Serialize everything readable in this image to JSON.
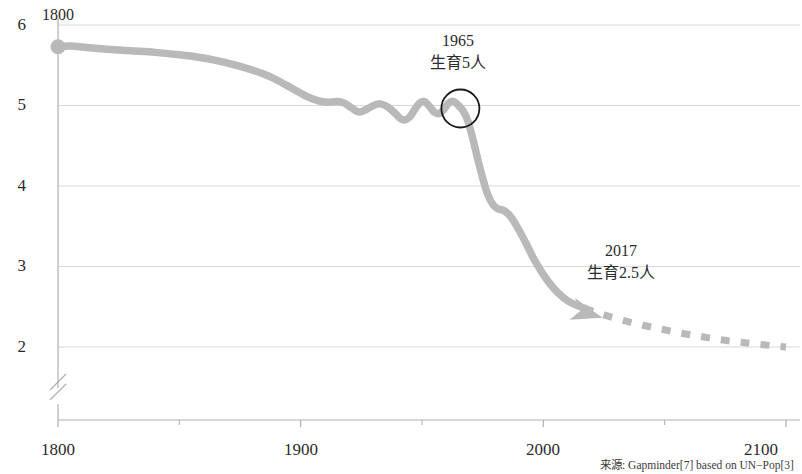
{
  "chart_data": {
    "type": "line",
    "title": "",
    "subtitle": "",
    "xlabel": "",
    "ylabel": "",
    "xlim": [
      1800,
      2100
    ],
    "ylim": [
      1.78,
      6.15
    ],
    "grid": true,
    "legend": null,
    "y_axis_break": true,
    "x_ticks": [
      "1800",
      "1900",
      "2000",
      "2100"
    ],
    "x_tick_values": [
      1800,
      1900,
      2000,
      2100
    ],
    "x_minor_tick_values": [
      1850,
      1950,
      2050
    ],
    "y_ticks": [
      "2",
      "3",
      "4",
      "5",
      "6"
    ],
    "y_tick_values": [
      2,
      3,
      4,
      5,
      6
    ],
    "line_color": "#b9b9b9",
    "series": [
      {
        "name": "historical",
        "style": "solid",
        "x": [
          1800,
          1805,
          1812,
          1820,
          1830,
          1840,
          1850,
          1858,
          1865,
          1872,
          1878,
          1884,
          1890,
          1896,
          1902,
          1907,
          1911,
          1915,
          1918,
          1921,
          1924,
          1927,
          1930,
          1933,
          1936,
          1939,
          1941,
          1943,
          1945,
          1947,
          1949,
          1951,
          1953,
          1955,
          1957,
          1959,
          1961,
          1963,
          1965,
          1967,
          1969,
          1971,
          1973,
          1975,
          1977,
          1979,
          1981,
          1984,
          1987,
          1990,
          1993,
          1996,
          2000,
          2004,
          2008,
          2012,
          2017
        ],
        "y": [
          5.73,
          5.74,
          5.72,
          5.7,
          5.68,
          5.66,
          5.63,
          5.6,
          5.56,
          5.51,
          5.46,
          5.4,
          5.32,
          5.22,
          5.12,
          5.06,
          5.04,
          5.05,
          5.03,
          4.97,
          4.92,
          4.95,
          5.0,
          5.02,
          4.98,
          4.9,
          4.84,
          4.82,
          4.86,
          4.95,
          5.03,
          5.05,
          4.99,
          4.92,
          4.9,
          4.95,
          5.03,
          5.05,
          5.0,
          4.93,
          4.8,
          4.58,
          4.33,
          4.1,
          3.9,
          3.78,
          3.72,
          3.69,
          3.6,
          3.45,
          3.28,
          3.1,
          2.9,
          2.74,
          2.62,
          2.54,
          2.48
        ]
      },
      {
        "name": "projection",
        "style": "dashed",
        "x": [
          2017,
          2025,
          2033,
          2041,
          2049,
          2057,
          2065,
          2073,
          2081,
          2090,
          2100
        ],
        "y": [
          2.48,
          2.4,
          2.33,
          2.27,
          2.22,
          2.17,
          2.13,
          2.09,
          2.06,
          2.03,
          2.0
        ]
      }
    ],
    "annotations": [
      {
        "id": "start-year",
        "label": "1800",
        "x": 1800,
        "y": 6.0,
        "kind": "text"
      },
      {
        "id": "marker-1965",
        "year": "1965",
        "text": "生育5人",
        "x": 1965,
        "y": 5.0,
        "kind": "circle-callout",
        "marker": "circle-outline"
      },
      {
        "id": "marker-2017",
        "year": "2017",
        "text": "生育2.5人",
        "x": 2017,
        "y": 2.5,
        "kind": "arrow-callout",
        "marker": "arrowhead"
      }
    ],
    "source_note": "来源: Gapminder[7] based on UN−Pop[3]"
  },
  "axes": {
    "y_labels": [
      "6",
      "5",
      "4",
      "3",
      "2"
    ],
    "x_labels": [
      "1800",
      "1900",
      "2000",
      "2100"
    ]
  },
  "annotations": {
    "start_label": "1800",
    "callout_1965": {
      "year": "1965",
      "text": "生育5人"
    },
    "callout_2017": {
      "year": "2017",
      "text": "生育2.5人"
    }
  },
  "footer": {
    "source": "来源: Gapminder[7] based on UN−Pop[3]"
  },
  "colors": {
    "line": "#b9b9b9",
    "grid": "#d9d9d9",
    "axis": "#b0b0b0",
    "text": "#2b2b2b"
  }
}
